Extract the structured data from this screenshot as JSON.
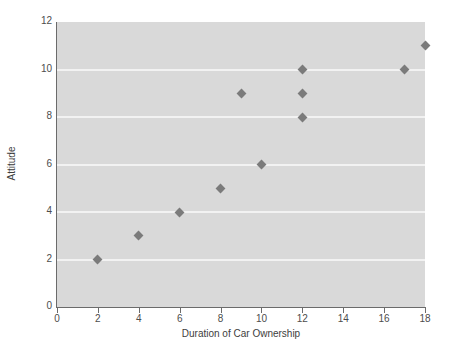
{
  "chart_data": {
    "type": "scatter",
    "title": "",
    "xlabel": "Duration of Car Ownership",
    "ylabel": "Attitude",
    "xlim": [
      0,
      18
    ],
    "ylim": [
      0,
      12
    ],
    "xticks": [
      0,
      2,
      4,
      6,
      8,
      10,
      12,
      14,
      16,
      18
    ],
    "yticks": [
      0,
      2,
      4,
      6,
      8,
      10,
      12
    ],
    "grid": "horizontal",
    "gridline_values": [
      2,
      4,
      6,
      8,
      10
    ],
    "legend": null,
    "marker_shape": "diamond",
    "marker_color": "#7b7b7b",
    "panel_color": "#d9d9d9",
    "gridline_color": "#f2f2f2",
    "points": [
      {
        "x": 2,
        "y": 2
      },
      {
        "x": 4,
        "y": 3
      },
      {
        "x": 6,
        "y": 4
      },
      {
        "x": 8,
        "y": 5
      },
      {
        "x": 9,
        "y": 9
      },
      {
        "x": 10,
        "y": 6
      },
      {
        "x": 12,
        "y": 8
      },
      {
        "x": 12,
        "y": 9
      },
      {
        "x": 12,
        "y": 10
      },
      {
        "x": 17,
        "y": 10
      },
      {
        "x": 18,
        "y": 11
      }
    ]
  }
}
